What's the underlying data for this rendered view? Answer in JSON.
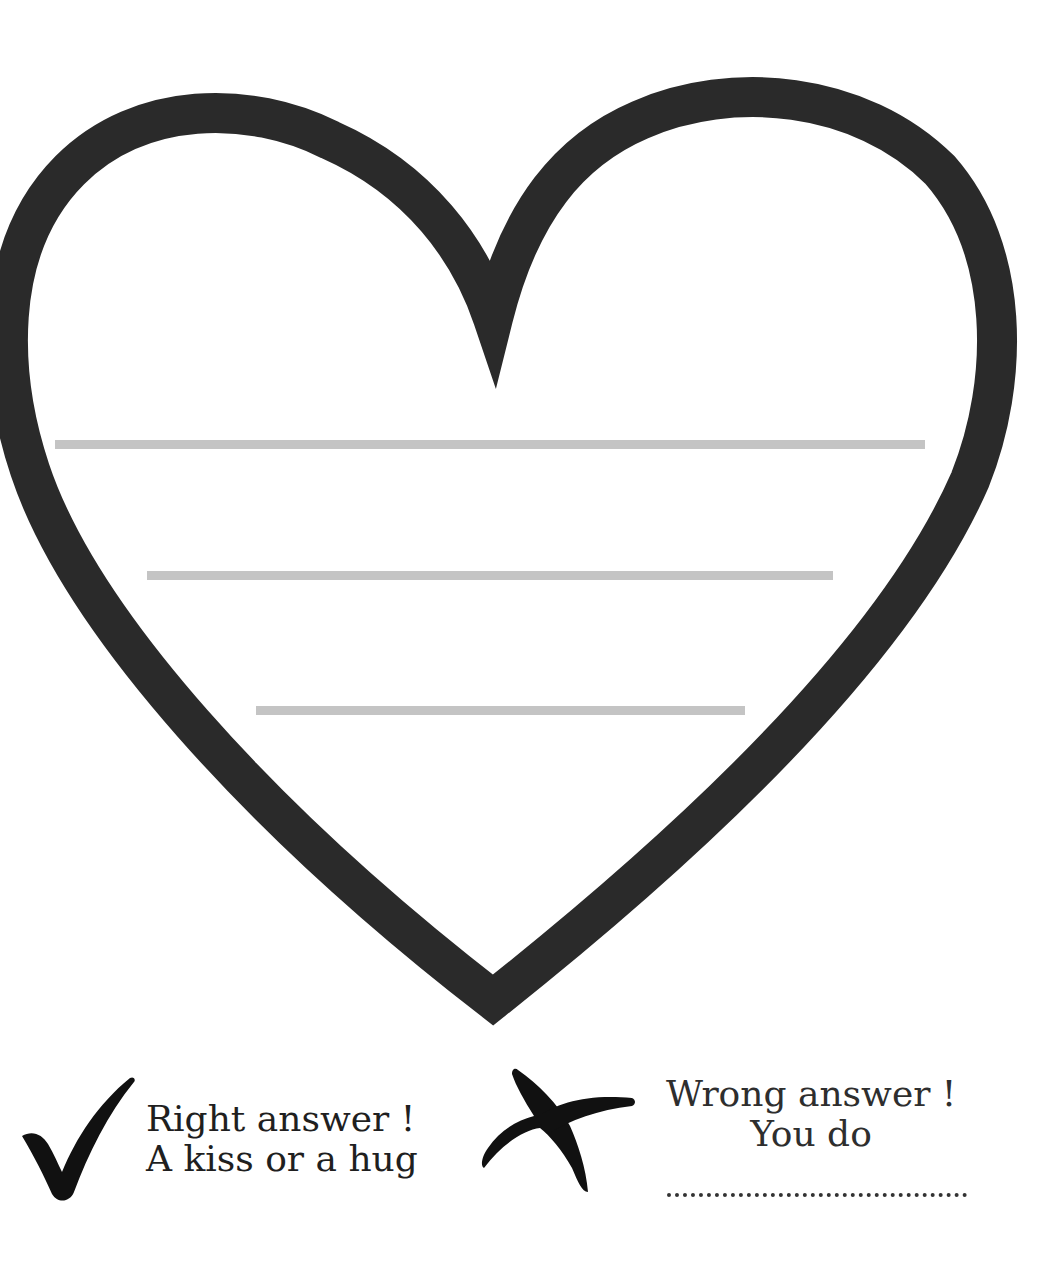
{
  "worksheet": {
    "heart": {
      "outline_color": "#2a2a2a",
      "fill_color": "#ffffff",
      "writing_lines_color": "#c4c4c4",
      "writing_lines": [
        {
          "x1": 55,
          "x2": 925,
          "y": 444
        },
        {
          "x1": 147,
          "x2": 833,
          "y": 575
        },
        {
          "x1": 256,
          "x2": 745,
          "y": 710
        }
      ]
    },
    "legend": {
      "right": {
        "icon": "checkmark-icon",
        "line1": "Right answer !",
        "line2": "A kiss or a hug"
      },
      "wrong": {
        "icon": "cross-icon",
        "line1": "Wrong answer !",
        "line2": "You do",
        "blank": "................................................"
      }
    }
  }
}
